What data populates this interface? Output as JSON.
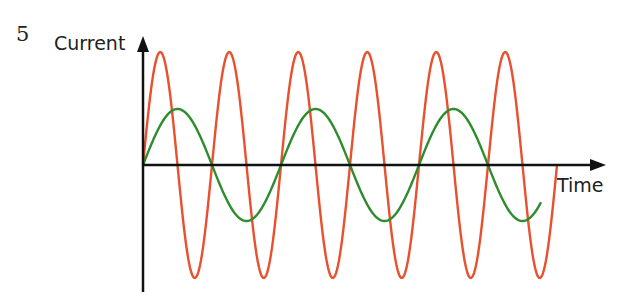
{
  "question_number": "5",
  "chart_data": {
    "type": "line",
    "title": "",
    "xlabel": "Time",
    "ylabel": "Current",
    "grid": false,
    "legend": null,
    "axes": {
      "origin_px": [
        143,
        165
      ],
      "x_end_px": 606,
      "y_top_px": 36,
      "y_bottom_px": 292
    },
    "series": [
      {
        "name": "high-frequency current",
        "color": "#e8502e",
        "amplitude_px": 113,
        "period_px": 69,
        "start_x_px": 143,
        "end_x_px": 557,
        "cycles": 6
      },
      {
        "name": "low-frequency current",
        "color": "#2e8b2e",
        "amplitude_px": 56,
        "period_px": 138,
        "start_x_px": 143,
        "end_x_px": 541,
        "cycles": 2.9
      }
    ]
  },
  "colors": {
    "axis": "#111111",
    "red": "#e8502e",
    "green": "#2e8b2e"
  }
}
